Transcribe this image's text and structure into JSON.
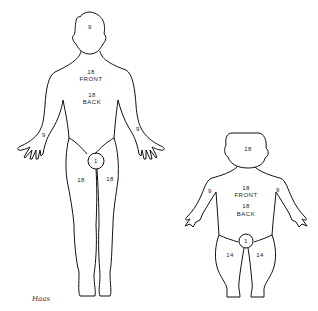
{
  "adult": {
    "head": "9",
    "front_value": "18",
    "front_label": "FRONT",
    "back_value": "18",
    "back_label": "BACK",
    "left_arm": "9",
    "right_arm": "9",
    "perineum": "1",
    "left_leg": "18",
    "right_leg": "18"
  },
  "child": {
    "head": "18",
    "front_value": "18",
    "front_label": "FRONT",
    "back_value": "18",
    "back_label": "BACK",
    "left_arm": "9",
    "right_arm": "9",
    "perineum": "1",
    "left_leg": "14",
    "right_leg": "14"
  },
  "signature": "Haas",
  "colors": {
    "line": "#111111",
    "background": "#ffffff"
  }
}
